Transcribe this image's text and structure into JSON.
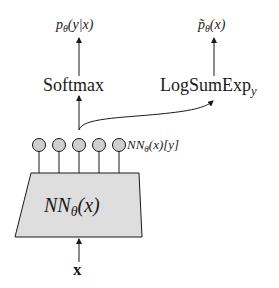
{
  "diagram": {
    "type": "neural-network-flow",
    "nodes": {
      "input": {
        "label": "x"
      },
      "network": {
        "label_main": "NN",
        "label_sub": "θ",
        "label_arg": "(x)"
      },
      "logits": {
        "count": 5,
        "label_main": "NN",
        "label_sub": "θ",
        "label_arg": "(x)[y]"
      },
      "softmax": {
        "label": "Softmax"
      },
      "logsumexp": {
        "label": "LogSumExp",
        "label_sub": "y"
      },
      "conditional_output": {
        "label_p": "p",
        "label_sub": "θ",
        "label_arg": "(y|x)"
      },
      "marginal_output": {
        "label_p": "p̃",
        "label_sub": "θ",
        "label_arg": "(x)"
      }
    },
    "edges": [
      {
        "from": "input",
        "to": "network"
      },
      {
        "from": "network",
        "to": "logits"
      },
      {
        "from": "logits",
        "to": "softmax"
      },
      {
        "from": "logits",
        "to": "logsumexp"
      },
      {
        "from": "softmax",
        "to": "conditional_output"
      },
      {
        "from": "logsumexp",
        "to": "marginal_output"
      }
    ],
    "colors": {
      "line": "#1a1a1a",
      "node_fill": "#cfcfcf",
      "box_fill": "#dedede"
    }
  }
}
